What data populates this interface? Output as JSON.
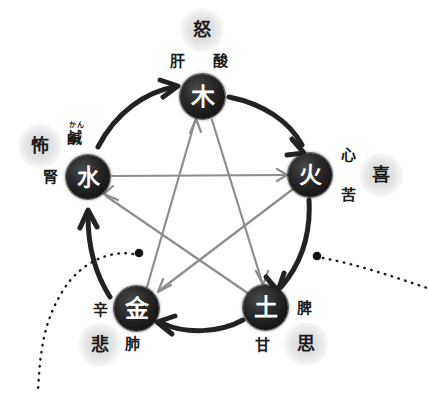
{
  "diagram": {
    "type": "wuxing-five-elements-cycle",
    "colors": {
      "node_fill": "#1a1a1a",
      "node_text": "#ffffff",
      "generating_arrow": "#262626",
      "overcoming_arrow": "#8a8a8a",
      "dotted_line": "#1a1a1a",
      "halo": "#c8c8c8",
      "background": "#ffffff"
    },
    "nodes": [
      {
        "id": "wood",
        "element": "木",
        "organ": "肝",
        "taste": "酸",
        "emotion": "怒",
        "furigana": ""
      },
      {
        "id": "fire",
        "element": "火",
        "organ": "心",
        "taste": "苦",
        "emotion": "喜",
        "furigana": ""
      },
      {
        "id": "earth",
        "element": "土",
        "organ": "脾",
        "taste": "甘",
        "emotion": "思",
        "furigana": ""
      },
      {
        "id": "metal",
        "element": "金",
        "organ": "肺",
        "taste": "辛",
        "emotion": "悲",
        "furigana": ""
      },
      {
        "id": "water",
        "element": "水",
        "organ": "腎",
        "taste": "鹹",
        "emotion": "怖",
        "furigana": "かん"
      }
    ],
    "generating_cycle": [
      {
        "from": "水",
        "to": "木"
      },
      {
        "from": "木",
        "to": "火"
      },
      {
        "from": "火",
        "to": "土"
      },
      {
        "from": "土",
        "to": "金"
      },
      {
        "from": "金",
        "to": "水"
      }
    ],
    "overcoming_cycle": [
      {
        "from": "木",
        "to": "土"
      },
      {
        "from": "土",
        "to": "水"
      },
      {
        "from": "水",
        "to": "火"
      },
      {
        "from": "火",
        "to": "金"
      },
      {
        "from": "金",
        "to": "木"
      }
    ],
    "annotations": [
      {
        "id": "pointer-left",
        "style": "dotted-curve-with-dot"
      },
      {
        "id": "pointer-right",
        "style": "dotted-line-with-dot"
      }
    ]
  }
}
